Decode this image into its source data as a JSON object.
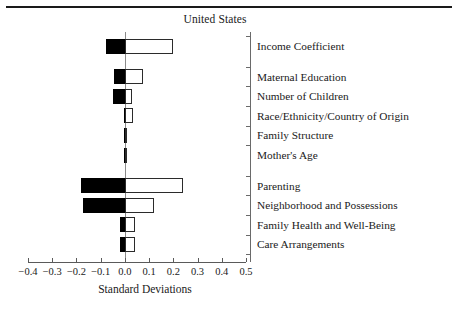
{
  "chart_data": {
    "type": "bar",
    "orientation": "horizontal",
    "title": "United States",
    "xlabel": "Standard Deviations",
    "ylabel": "",
    "xlim": [
      -0.4,
      0.5
    ],
    "xticks": [
      -0.4,
      -0.3,
      -0.2,
      -0.1,
      0.0,
      0.1,
      0.2,
      0.3,
      0.4,
      0.5
    ],
    "xtick_labels": [
      "−0.4",
      "−0.3",
      "−0.2",
      "−0.1",
      "0.0",
      "0.1",
      "0.2",
      "0.3",
      "0.4",
      "0.5"
    ],
    "grid": false,
    "legend": null,
    "categories": [
      "Income Coefficient",
      "Maternal Education",
      "Number of Children",
      "Race/Ethnicity/Country of Origin",
      "Family Structure",
      "Mother's Age",
      "Parenting",
      "Neighborhood and Possessions",
      "Family Health and Well-Being",
      "Care Arrangements"
    ],
    "series": [
      {
        "name": "negative",
        "fill": "#000000",
        "values": [
          -0.08,
          -0.045,
          -0.05,
          -0.005,
          -0.002,
          -0.002,
          -0.18,
          -0.175,
          -0.02,
          -0.02
        ]
      },
      {
        "name": "positive",
        "fill": "#ffffff",
        "values": [
          0.2,
          0.075,
          0.03,
          0.035,
          0.002,
          0.002,
          0.24,
          0.12,
          0.04,
          0.04
        ]
      }
    ],
    "row_gaps_after": [
      0,
      5
    ],
    "zero_reference": 0.0
  }
}
